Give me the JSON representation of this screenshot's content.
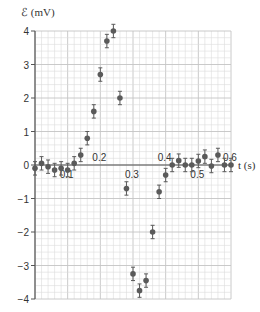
{
  "chart_data": {
    "type": "scatter",
    "title": "",
    "xlabel": "t (s)",
    "ylabel": "ℰ (mV)",
    "xlim": [
      0,
      0.6
    ],
    "ylim": [
      -4,
      4
    ],
    "grid": true,
    "x_ticks": [
      0.1,
      0.2,
      0.3,
      0.4,
      0.5,
      0.6
    ],
    "x_tick_labels": [
      "0.1",
      "0.2",
      "0.3",
      "0.4",
      "0.5",
      "0.6"
    ],
    "y_ticks": [
      4,
      3,
      2,
      1,
      0,
      -1,
      -2,
      -3,
      -4
    ],
    "y_tick_labels": [
      "4",
      "3",
      "2",
      "1",
      "0",
      "−1",
      "−2",
      "−3",
      "−4"
    ],
    "error_bar": 0.2,
    "series": [
      {
        "name": "emf",
        "x": [
          0,
          0.02,
          0.04,
          0.06,
          0.08,
          0.1,
          0.12,
          0.14,
          0.16,
          0.18,
          0.2,
          0.22,
          0.24,
          0.26,
          0.28,
          0.3,
          0.32,
          0.34,
          0.36,
          0.38,
          0.4,
          0.42,
          0.44,
          0.46,
          0.48,
          0.5,
          0.52,
          0.54,
          0.56,
          0.58,
          0.6
        ],
        "values": [
          -0.1,
          0.05,
          -0.05,
          -0.15,
          -0.1,
          -0.15,
          0.05,
          0.3,
          0.8,
          1.6,
          2.7,
          3.7,
          4.0,
          2.0,
          -0.7,
          -3.25,
          -3.75,
          -3.45,
          -2.0,
          -0.8,
          -0.3,
          0.0,
          0.13,
          0.0,
          0.0,
          0.12,
          0.25,
          -0.03,
          0.3,
          0.0,
          0.0
        ]
      }
    ]
  },
  "colors": {
    "marker": "#5a5a5a",
    "grid_minor": "#dcdcdc",
    "grid_major": "#c4c4c4",
    "axis": "#555555"
  }
}
